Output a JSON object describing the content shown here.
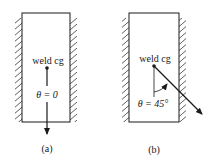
{
  "figure": {
    "panels": [
      {
        "id": "a",
        "caption": "(a)",
        "label_cg": "weld cg",
        "label_angle": "θ = 0",
        "angle_deg": 0
      },
      {
        "id": "b",
        "caption": "(b)",
        "label_cg": "weld cg",
        "label_angle": "θ = 45°",
        "angle_deg": 45
      }
    ]
  },
  "colors": {
    "line": "#1a1a1a",
    "background": "#ffffff"
  }
}
